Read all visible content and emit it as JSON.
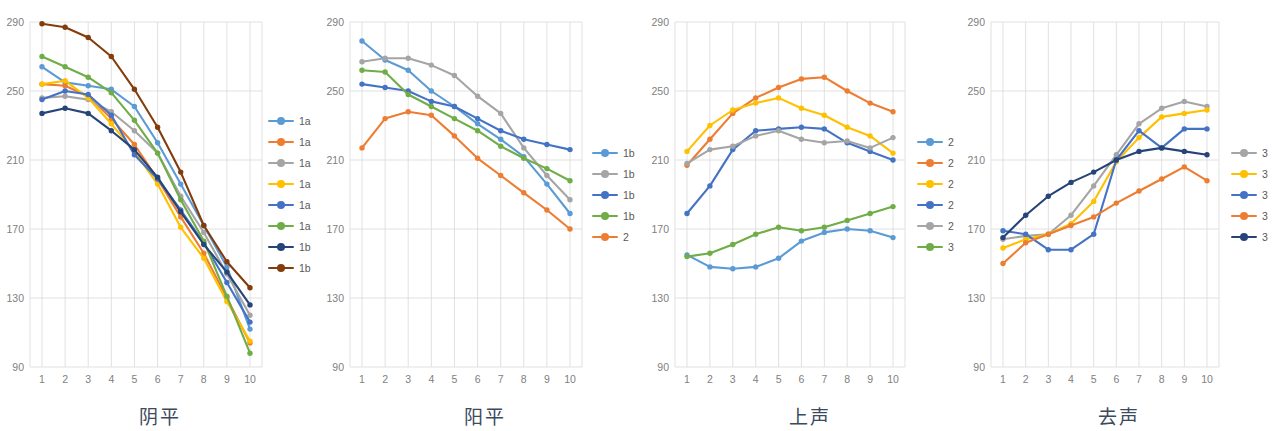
{
  "figure": {
    "panel_count": 4,
    "axis": {
      "y_ticks": [
        90,
        130,
        170,
        210,
        250,
        290
      ],
      "ylim": [
        90,
        290
      ],
      "x_ticks": [
        1,
        2,
        3,
        4,
        5,
        6,
        7,
        8,
        9,
        10
      ],
      "xlim": [
        1,
        10
      ],
      "grid": true,
      "legend_position": "right"
    },
    "colors": {
      "blue": "#5b9bd5",
      "orange": "#ed7d31",
      "gray": "#a5a5a5",
      "yellow": "#ffc000",
      "darkblue": "#4472c4",
      "green": "#70ad47",
      "navy": "#264478",
      "brown": "#843c0c"
    }
  },
  "chart_data": [
    {
      "type": "line",
      "title": "阴平",
      "xlabel": "",
      "ylabel": "",
      "ylim": [
        90,
        290
      ],
      "x": [
        1,
        2,
        3,
        4,
        5,
        6,
        7,
        8,
        9,
        10
      ],
      "legend": [
        "1a",
        "1a",
        "1a",
        "1a",
        "1a",
        "1a",
        "1b",
        "1b"
      ],
      "series": [
        {
          "name": "1a",
          "color": "#5b9bd5",
          "values": [
            264,
            255,
            253,
            251,
            241,
            220,
            196,
            172,
            148,
            112
          ]
        },
        {
          "name": "1a",
          "color": "#ed7d31",
          "values": [
            254,
            253,
            247,
            234,
            219,
            199,
            177,
            156,
            130,
            104
          ]
        },
        {
          "name": "1a",
          "color": "#a5a5a5",
          "values": [
            246,
            247,
            245,
            238,
            227,
            214,
            189,
            168,
            144,
            120
          ]
        },
        {
          "name": "1a",
          "color": "#ffc000",
          "values": [
            254,
            256,
            246,
            231,
            215,
            196,
            171,
            153,
            128,
            105
          ]
        },
        {
          "name": "1a",
          "color": "#4472c4",
          "values": [
            245,
            250,
            248,
            236,
            213,
            199,
            181,
            162,
            139,
            116
          ]
        },
        {
          "name": "1a",
          "color": "#70ad47",
          "values": [
            270,
            264,
            258,
            249,
            233,
            214,
            187,
            163,
            131,
            98
          ]
        },
        {
          "name": "1b",
          "color": "#264478",
          "values": [
            237,
            240,
            237,
            227,
            216,
            200,
            180,
            161,
            145,
            126
          ]
        },
        {
          "name": "1b",
          "color": "#843c0c",
          "values": [
            289,
            287,
            281,
            270,
            251,
            229,
            203,
            172,
            151,
            136
          ]
        }
      ]
    },
    {
      "type": "line",
      "title": "阳平",
      "xlabel": "",
      "ylabel": "",
      "ylim": [
        90,
        290
      ],
      "x": [
        1,
        2,
        3,
        4,
        5,
        6,
        7,
        8,
        9,
        10
      ],
      "legend": [
        "1b",
        "1b",
        "1b",
        "1b",
        "2"
      ],
      "series": [
        {
          "name": "1b",
          "color": "#5b9bd5",
          "values": [
            279,
            268,
            262,
            250,
            241,
            231,
            222,
            212,
            196,
            179
          ]
        },
        {
          "name": "1b",
          "color": "#a5a5a5",
          "values": [
            267,
            269,
            269,
            265,
            259,
            247,
            237,
            217,
            201,
            187
          ]
        },
        {
          "name": "1b",
          "color": "#4472c4",
          "values": [
            254,
            252,
            250,
            244,
            241,
            234,
            227,
            222,
            219,
            216
          ]
        },
        {
          "name": "1b",
          "color": "#70ad47",
          "values": [
            262,
            261,
            248,
            241,
            234,
            227,
            218,
            211,
            205,
            198
          ]
        },
        {
          "name": "2",
          "color": "#ed7d31",
          "values": [
            217,
            234,
            238,
            236,
            224,
            211,
            201,
            191,
            181,
            170
          ]
        }
      ]
    },
    {
      "type": "line",
      "title": "上声",
      "xlabel": "",
      "ylabel": "",
      "ylim": [
        90,
        290
      ],
      "x": [
        1,
        2,
        3,
        4,
        5,
        6,
        7,
        8,
        9,
        10
      ],
      "legend": [
        "2",
        "2",
        "2",
        "2",
        "2",
        "3"
      ],
      "series": [
        {
          "name": "2",
          "color": "#5b9bd5",
          "values": [
            155,
            148,
            147,
            148,
            153,
            163,
            168,
            170,
            169,
            165
          ]
        },
        {
          "name": "2",
          "color": "#ed7d31",
          "values": [
            207,
            222,
            237,
            246,
            252,
            257,
            258,
            250,
            243,
            238
          ]
        },
        {
          "name": "2",
          "color": "#ffc000",
          "values": [
            215,
            230,
            239,
            243,
            246,
            240,
            236,
            229,
            224,
            214
          ]
        },
        {
          "name": "2",
          "color": "#4472c4",
          "values": [
            179,
            195,
            216,
            227,
            228,
            229,
            228,
            220,
            215,
            210
          ]
        },
        {
          "name": "2",
          "color": "#a5a5a5",
          "values": [
            208,
            216,
            218,
            224,
            227,
            222,
            220,
            221,
            217,
            223
          ]
        },
        {
          "name": "3",
          "color": "#70ad47",
          "values": [
            154,
            156,
            161,
            167,
            171,
            169,
            171,
            175,
            179,
            183
          ]
        }
      ]
    },
    {
      "type": "line",
      "title": "去声",
      "xlabel": "",
      "ylabel": "",
      "ylim": [
        90,
        290
      ],
      "x": [
        1,
        2,
        3,
        4,
        5,
        6,
        7,
        8,
        9,
        10
      ],
      "legend": [
        "3",
        "3",
        "3",
        "3",
        "3"
      ],
      "series": [
        {
          "name": "3",
          "color": "#a5a5a5",
          "values": [
            164,
            166,
            167,
            178,
            195,
            213,
            231,
            240,
            244,
            241
          ]
        },
        {
          "name": "3",
          "color": "#ffc000",
          "values": [
            159,
            164,
            167,
            173,
            186,
            209,
            223,
            235,
            237,
            239
          ]
        },
        {
          "name": "3",
          "color": "#4472c4",
          "values": [
            169,
            167,
            158,
            158,
            167,
            210,
            227,
            217,
            228,
            228
          ]
        },
        {
          "name": "3",
          "color": "#ed7d31",
          "values": [
            150,
            162,
            167,
            172,
            177,
            185,
            192,
            199,
            206,
            198
          ]
        },
        {
          "name": "3",
          "color": "#264478",
          "values": [
            165,
            178,
            189,
            197,
            203,
            210,
            215,
            217,
            215,
            213
          ]
        }
      ]
    }
  ]
}
